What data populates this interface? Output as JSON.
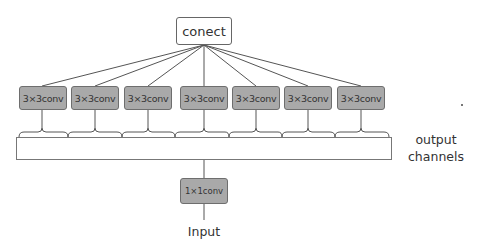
{
  "diagram": {
    "top_node": {
      "label": "conect"
    },
    "conv_nodes": [
      {
        "label": "3×3conv"
      },
      {
        "label": "3×3conv"
      },
      {
        "label": "3×3conv"
      },
      {
        "label": "3×3conv"
      },
      {
        "label": "3×3conv"
      },
      {
        "label": "3×3conv"
      },
      {
        "label": "3×3conv"
      }
    ],
    "output_bar": {
      "label": "output channels",
      "line1": "output",
      "line2": "channels"
    },
    "bottom_node": {
      "label": "1×1conv"
    },
    "input": {
      "label": "Input"
    }
  },
  "colors": {
    "conv_fill": "#a9a9a9",
    "conv_border": "#6e6e6e",
    "line": "#555555",
    "background": "#ffffff"
  }
}
